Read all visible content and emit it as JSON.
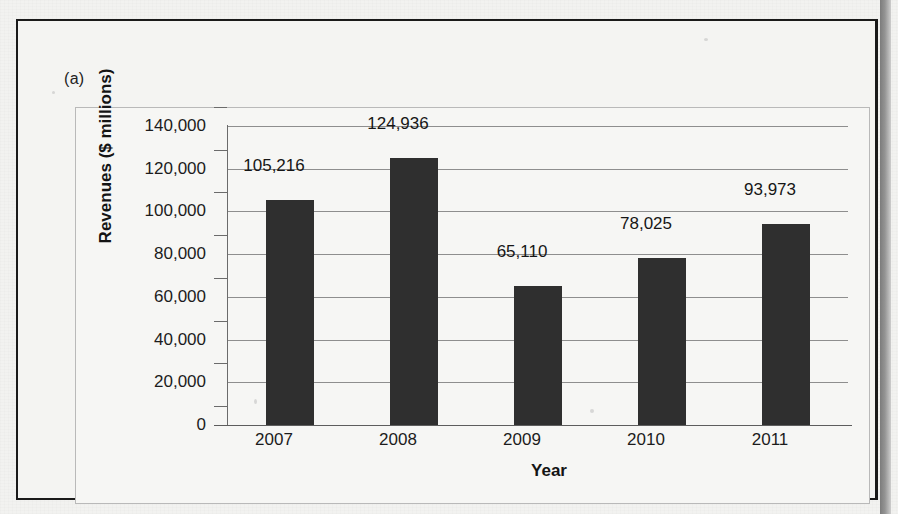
{
  "figure": {
    "panel_label": "(a)"
  },
  "chart_data": {
    "type": "bar",
    "title": "",
    "xlabel": "Year",
    "ylabel": "Revenues ($ millions)",
    "categories": [
      "2007",
      "2008",
      "2009",
      "2010",
      "2011"
    ],
    "values": [
      105216,
      124936,
      65110,
      78025,
      93973
    ],
    "value_labels": [
      "105,216",
      "124,936",
      "65,110",
      "78,025",
      "93,973"
    ],
    "ylim": [
      0,
      140000
    ],
    "ytick_values": [
      0,
      20000,
      40000,
      60000,
      80000,
      100000,
      120000,
      140000
    ],
    "ytick_labels": [
      "0",
      "20,000",
      "40,000",
      "60,000",
      "80,000",
      "100,000",
      "120,000",
      "140,000"
    ],
    "grid": true,
    "legend": "none",
    "bar_color": "#2f2f2f",
    "series": [
      {
        "name": "Revenues",
        "values": [
          105216,
          124936,
          65110,
          78025,
          93973
        ]
      }
    ]
  }
}
